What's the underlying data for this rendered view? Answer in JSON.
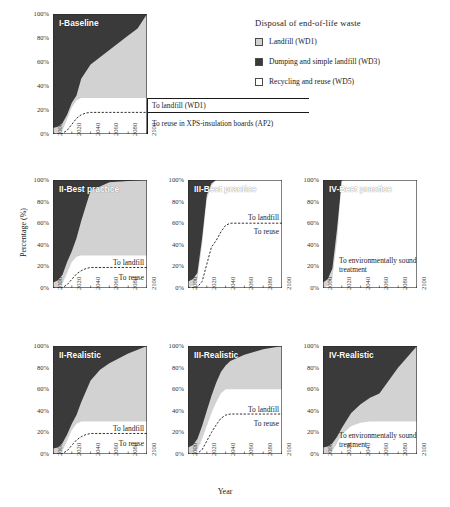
{
  "figure": {
    "xlabel": "Year",
    "ylabel": "Percentage (%)"
  },
  "legend": {
    "title": "Disposal of end-of-life waste",
    "items": [
      {
        "label": "Landfill (WD1)",
        "color": "#d2d2d2",
        "swatch": "wd1"
      },
      {
        "label": "Dumping and simple landfill (WD3)",
        "color": "#3a3a3a",
        "swatch": "wd3"
      },
      {
        "label": "Recycling and reuse (WD5)",
        "color": "#ffffff",
        "swatch": "wd5"
      }
    ]
  },
  "axes": {
    "yticks": [
      "100%",
      "80%",
      "60%",
      "40%",
      "20%",
      "0%"
    ],
    "ytick_values": [
      100,
      80,
      60,
      40,
      20,
      0
    ],
    "xticks": [
      "2000",
      "2020",
      "2040",
      "2060",
      "2080",
      "2100"
    ],
    "xtick_values": [
      2000,
      2020,
      2040,
      2060,
      2080,
      2100
    ],
    "xlim": [
      2000,
      2100
    ],
    "ylim": [
      0,
      100
    ]
  },
  "chart_data": {
    "type": "area",
    "title": "Disposal of end-of-life waste",
    "xlabel": "Year",
    "ylabel": "Percentage (%)",
    "xlim": [
      2000,
      2100
    ],
    "ylim": [
      0,
      100
    ],
    "grid": false,
    "legend_position": "top-right",
    "stack_order_bottom_to_top": [
      "Recycling and reuse (WD5)",
      "Landfill (WD1)",
      "Dumping and simple landfill (WD3)"
    ],
    "panels": [
      {
        "id": "I-Baseline",
        "title": "I-Baseline",
        "row": 0,
        "col": 0,
        "x": [
          2000,
          2005,
          2010,
          2015,
          2020,
          2025,
          2030,
          2040,
          2050,
          2060,
          2070,
          2080,
          2090,
          2100
        ],
        "series": [
          {
            "name": "Recycling and reuse (WD5)",
            "color": "#ffffff",
            "values": [
              0,
              1,
              3,
              12,
              22,
              28,
              30,
              30,
              30,
              30,
              30,
              30,
              30,
              30
            ]
          },
          {
            "name": "Landfill (WD1)",
            "color": "#d2d2d2",
            "values": [
              5,
              6,
              9,
              16,
              26,
              32,
              46,
              58,
              64,
              70,
              76,
              82,
              88,
              100
            ]
          },
          {
            "name": "Dumping and simple landfill (WD3)",
            "color": "#3a3a3a",
            "values": [
              100,
              100,
              100,
              100,
              100,
              100,
              100,
              100,
              100,
              100,
              100,
              100,
              100,
              100
            ]
          }
        ],
        "dashed_line": {
          "name": "To reuse in XPS-insulation boards (AP2)",
          "x": [
            2000,
            2010,
            2015,
            2020,
            2025,
            2030,
            2035,
            2040,
            2100
          ],
          "values": [
            0,
            0.5,
            3,
            8,
            13,
            16,
            17.5,
            18,
            18
          ]
        },
        "annotations": [
          {
            "text": "To landfill (WD1)",
            "at_percent": 24
          },
          {
            "text": "To reuse in XPS-insulation boards (AP2)",
            "at_percent": 9
          }
        ]
      },
      {
        "id": "II-Best practice",
        "title": "II-Best practice",
        "row": 1,
        "col": 0,
        "x": [
          2000,
          2005,
          2010,
          2015,
          2020,
          2025,
          2030,
          2040,
          2060,
          2080,
          2100
        ],
        "series": [
          {
            "name": "Recycling and reuse (WD5)",
            "color": "#ffffff",
            "values": [
              0,
              1,
              4,
              14,
              24,
              29,
              30,
              30,
              30,
              30,
              30
            ]
          },
          {
            "name": "Landfill (WD1)",
            "color": "#d2d2d2",
            "values": [
              5,
              7,
              12,
              24,
              34,
              46,
              62,
              90,
              98,
              99,
              100
            ]
          },
          {
            "name": "Dumping and simple landfill (WD3)",
            "color": "#3a3a3a",
            "values": [
              100,
              100,
              100,
              100,
              100,
              100,
              100,
              100,
              100,
              100,
              100
            ]
          }
        ],
        "dashed_line": {
          "name": "To reuse",
          "x": [
            2000,
            2010,
            2015,
            2020,
            2025,
            2030,
            2035,
            2040,
            2100
          ],
          "values": [
            0,
            0.5,
            3,
            8,
            13,
            16,
            18,
            19,
            19
          ]
        },
        "annotations": [
          {
            "text": "To landfill",
            "at_percent": 24
          },
          {
            "text": "To reuse",
            "at_percent": 10
          }
        ]
      },
      {
        "id": "III-Best practice",
        "title": "III-Best practice",
        "row": 1,
        "col": 1,
        "x": [
          2000,
          2005,
          2010,
          2015,
          2020,
          2025,
          2030,
          2040,
          2060,
          2080,
          2100
        ],
        "series": [
          {
            "name": "Recycling and reuse (WD5)",
            "color": "#ffffff",
            "values": [
              0,
              2,
              8,
              40,
              82,
              95,
              100,
              100,
              100,
              100,
              100
            ]
          },
          {
            "name": "Landfill (WD1)",
            "color": "#d2d2d2",
            "values": [
              6,
              8,
              14,
              46,
              86,
              97,
              100,
              100,
              100,
              100,
              100
            ]
          },
          {
            "name": "Dumping and simple landfill (WD3)",
            "color": "#3a3a3a",
            "values": [
              100,
              100,
              100,
              100,
              100,
              100,
              100,
              100,
              100,
              100,
              100
            ]
          }
        ],
        "dashed_line": {
          "name": "To reuse",
          "x": [
            2000,
            2010,
            2015,
            2020,
            2025,
            2030,
            2035,
            2040,
            2045,
            2100
          ],
          "values": [
            0,
            1,
            6,
            22,
            38,
            44,
            52,
            58,
            60,
            60
          ]
        },
        "annotations": [
          {
            "text": "To landfill",
            "at_percent": 66
          },
          {
            "text": "To reuse",
            "at_percent": 53
          }
        ]
      },
      {
        "id": "IV-Best practice",
        "title": "IV-Best practice",
        "row": 1,
        "col": 2,
        "x": [
          2000,
          2005,
          2010,
          2015,
          2020,
          2025,
          2100
        ],
        "series": [
          {
            "name": "Recycling and reuse (WD5)",
            "color": "#ffffff",
            "values": [
              0,
              2,
              10,
              45,
              99,
              100,
              100
            ]
          },
          {
            "name": "Landfill (WD1)",
            "color": "#d2d2d2",
            "values": [
              5,
              8,
              18,
              55,
              100,
              100,
              100
            ]
          },
          {
            "name": "Dumping and simple landfill (WD3)",
            "color": "#3a3a3a",
            "values": [
              100,
              100,
              100,
              100,
              100,
              100,
              100
            ]
          }
        ],
        "dashed_line": null,
        "annotations": [
          {
            "text": "To environmentally sound treatment",
            "at_percent": 26
          }
        ]
      },
      {
        "id": "II-Realistic",
        "title": "II-Realistic",
        "row": 2,
        "col": 0,
        "x": [
          2000,
          2005,
          2010,
          2015,
          2020,
          2025,
          2030,
          2040,
          2050,
          2060,
          2080,
          2100
        ],
        "series": [
          {
            "name": "Recycling and reuse (WD5)",
            "color": "#ffffff",
            "values": [
              0,
              1,
              3,
              12,
              22,
              28,
              30,
              30,
              30,
              30,
              30,
              30
            ]
          },
          {
            "name": "Landfill (WD1)",
            "color": "#d2d2d2",
            "values": [
              5,
              6,
              10,
              18,
              28,
              36,
              48,
              68,
              78,
              84,
              93,
              100
            ]
          },
          {
            "name": "Dumping and simple landfill (WD3)",
            "color": "#3a3a3a",
            "values": [
              100,
              100,
              100,
              100,
              100,
              100,
              100,
              100,
              100,
              100,
              100,
              100
            ]
          }
        ],
        "dashed_line": {
          "name": "To reuse",
          "x": [
            2000,
            2010,
            2015,
            2020,
            2025,
            2030,
            2035,
            2040,
            2100
          ],
          "values": [
            0,
            0.5,
            3,
            8,
            13,
            16,
            18,
            19,
            19
          ]
        },
        "annotations": [
          {
            "text": "To landfill",
            "at_percent": 24
          },
          {
            "text": "To reuse",
            "at_percent": 10
          }
        ]
      },
      {
        "id": "III-Realistic",
        "title": "III-Realistic",
        "row": 2,
        "col": 1,
        "x": [
          2000,
          2005,
          2010,
          2015,
          2020,
          2025,
          2030,
          2035,
          2040,
          2045,
          2060,
          2080,
          2100
        ],
        "series": [
          {
            "name": "Recycling and reuse (WD5)",
            "color": "#ffffff",
            "values": [
              0,
              1,
              4,
              14,
              26,
              38,
              48,
              56,
              60,
              60,
              60,
              60,
              60
            ]
          },
          {
            "name": "Landfill (WD1)",
            "color": "#d2d2d2",
            "values": [
              6,
              8,
              14,
              26,
              40,
              54,
              66,
              76,
              82,
              86,
              92,
              97,
              100
            ]
          },
          {
            "name": "Dumping and simple landfill (WD3)",
            "color": "#3a3a3a",
            "values": [
              100,
              100,
              100,
              100,
              100,
              100,
              100,
              100,
              100,
              100,
              100,
              100,
              100
            ]
          }
        ],
        "dashed_line": {
          "name": "To reuse",
          "x": [
            2000,
            2010,
            2015,
            2020,
            2025,
            2030,
            2035,
            2040,
            2045,
            2100
          ],
          "values": [
            0,
            0.5,
            4,
            12,
            20,
            27,
            33,
            36,
            37,
            37
          ]
        },
        "annotations": [
          {
            "text": "To landfill",
            "at_percent": 42
          },
          {
            "text": "To reuse",
            "at_percent": 29
          }
        ]
      },
      {
        "id": "IV-Realistic",
        "title": "IV-Realistic",
        "row": 2,
        "col": 2,
        "x": [
          2000,
          2005,
          2010,
          2015,
          2020,
          2030,
          2040,
          2050,
          2060,
          2070,
          2080,
          2090,
          2100
        ],
        "series": [
          {
            "name": "Recycling and reuse (WD5)",
            "color": "#ffffff",
            "values": [
              0,
              1,
              3,
              10,
              18,
              26,
              29,
              30,
              30,
              30,
              30,
              30,
              30
            ]
          },
          {
            "name": "Landfill (WD1)",
            "color": "#d2d2d2",
            "values": [
              6,
              7,
              10,
              16,
              24,
              38,
              46,
              52,
              56,
              68,
              80,
              90,
              100
            ]
          },
          {
            "name": "Dumping and simple landfill (WD3)",
            "color": "#3a3a3a",
            "values": [
              100,
              100,
              100,
              100,
              100,
              100,
              100,
              100,
              100,
              100,
              100,
              100,
              100
            ]
          }
        ],
        "dashed_line": null,
        "annotations": [
          {
            "text": "To environmentally sound treatment",
            "at_percent": 18
          }
        ]
      }
    ]
  }
}
